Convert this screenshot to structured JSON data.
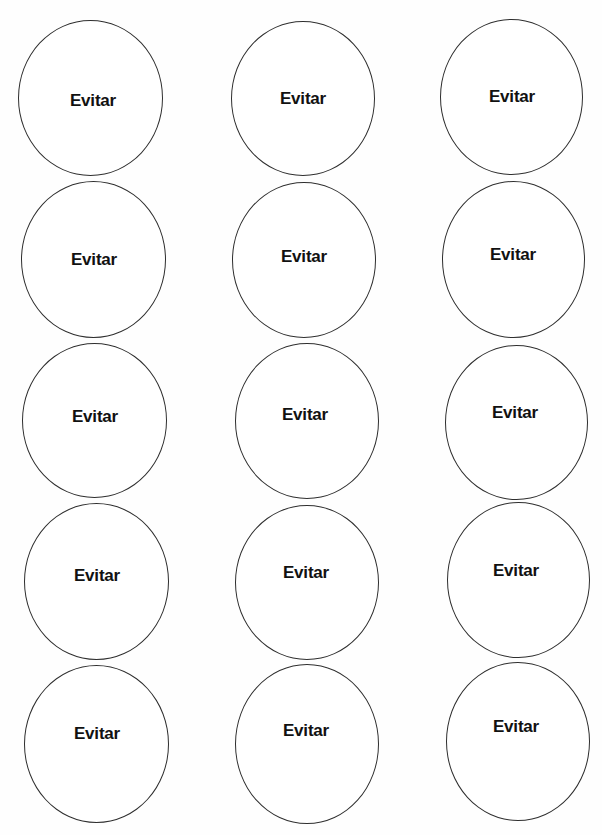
{
  "document": {
    "type": "printable-circle-labels-sheet",
    "rows": 5,
    "columns": 3,
    "stroke_color": "#2e2e2e",
    "text_color": "#111111",
    "background": "#ffffff"
  },
  "circles": [
    {
      "row": 1,
      "col": 1,
      "label": "Evitar",
      "x": 18,
      "y": 20,
      "w": 145,
      "h": 156,
      "tx": 93,
      "ty": 100
    },
    {
      "row": 1,
      "col": 2,
      "label": "Evitar",
      "x": 231,
      "y": 21,
      "w": 144,
      "h": 155,
      "tx": 303,
      "ty": 98
    },
    {
      "row": 1,
      "col": 3,
      "label": "Evitar",
      "x": 440,
      "y": 19,
      "w": 143,
      "h": 156,
      "tx": 512,
      "ty": 96
    },
    {
      "row": 2,
      "col": 1,
      "label": "Evitar",
      "x": 21,
      "y": 181,
      "w": 145,
      "h": 157,
      "tx": 94,
      "ty": 259
    },
    {
      "row": 2,
      "col": 2,
      "label": "Evitar",
      "x": 232,
      "y": 182,
      "w": 144,
      "h": 156,
      "tx": 304,
      "ty": 256
    },
    {
      "row": 2,
      "col": 3,
      "label": "Evitar",
      "x": 442,
      "y": 181,
      "w": 143,
      "h": 157,
      "tx": 513,
      "ty": 254
    },
    {
      "row": 3,
      "col": 1,
      "label": "Evitar",
      "x": 22,
      "y": 343,
      "w": 145,
      "h": 155,
      "tx": 95,
      "ty": 416
    },
    {
      "row": 3,
      "col": 2,
      "label": "Evitar",
      "x": 235,
      "y": 343,
      "w": 144,
      "h": 156,
      "tx": 305,
      "ty": 414
    },
    {
      "row": 3,
      "col": 3,
      "label": "Evitar",
      "x": 445,
      "y": 345,
      "w": 143,
      "h": 155,
      "tx": 515,
      "ty": 412
    },
    {
      "row": 4,
      "col": 1,
      "label": "Evitar",
      "x": 24,
      "y": 503,
      "w": 145,
      "h": 157,
      "tx": 97,
      "ty": 575
    },
    {
      "row": 4,
      "col": 2,
      "label": "Evitar",
      "x": 235,
      "y": 505,
      "w": 144,
      "h": 155,
      "tx": 306,
      "ty": 572
    },
    {
      "row": 4,
      "col": 3,
      "label": "Evitar",
      "x": 447,
      "y": 502,
      "w": 143,
      "h": 156,
      "tx": 516,
      "ty": 570
    },
    {
      "row": 5,
      "col": 1,
      "label": "Evitar",
      "x": 24,
      "y": 665,
      "w": 145,
      "h": 158,
      "tx": 97,
      "ty": 733
    },
    {
      "row": 5,
      "col": 2,
      "label": "Evitar",
      "x": 235,
      "y": 664,
      "w": 144,
      "h": 160,
      "tx": 306,
      "ty": 730
    },
    {
      "row": 5,
      "col": 3,
      "label": "Evitar",
      "x": 446,
      "y": 662,
      "w": 144,
      "h": 159,
      "tx": 516,
      "ty": 726
    }
  ]
}
